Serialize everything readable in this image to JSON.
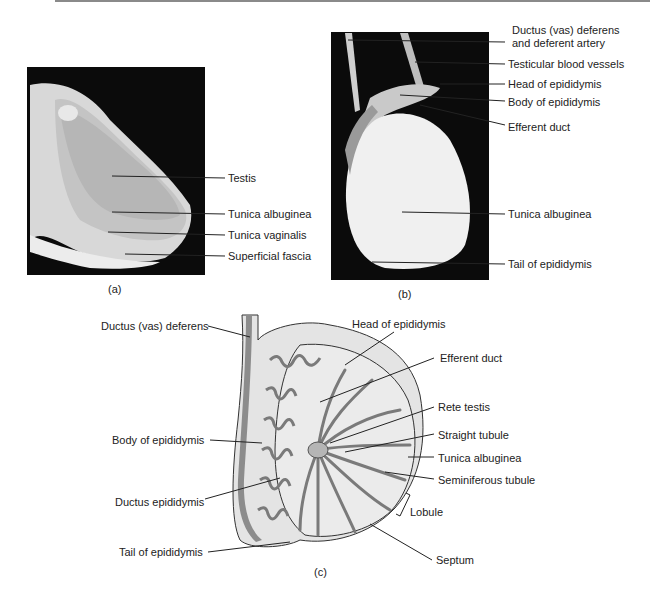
{
  "panels": {
    "a": {
      "caption": "(a)",
      "labels": [
        "Testis",
        "Tunica albuginea",
        "Tunica vaginalis",
        "Superficial fascia"
      ]
    },
    "b": {
      "caption": "(b)",
      "labels": [
        "Ductus (vas) deferens",
        "and deferent artery",
        "Testicular blood vessels",
        "Head of epididymis",
        "Body of epididymis",
        "Efferent duct",
        "Tunica albuginea",
        "Tail of epididymis"
      ]
    },
    "c": {
      "caption": "(c)",
      "left_labels": [
        "Ductus (vas) deferens",
        "Body of epididymis",
        "Ductus epididymis",
        "Tail of epididymis"
      ],
      "right_labels": [
        "Head of epididymis",
        "Efferent duct",
        "Rete testis",
        "Straight tubule",
        "Tunica albuginea",
        "Seminiferous tubule",
        "Lobule",
        "Septum"
      ]
    }
  },
  "colors": {
    "photo_bg": "#0a0a0a",
    "tissue": "#e6e6e6",
    "tubule": "#8c8c8c",
    "line": "#222222"
  }
}
